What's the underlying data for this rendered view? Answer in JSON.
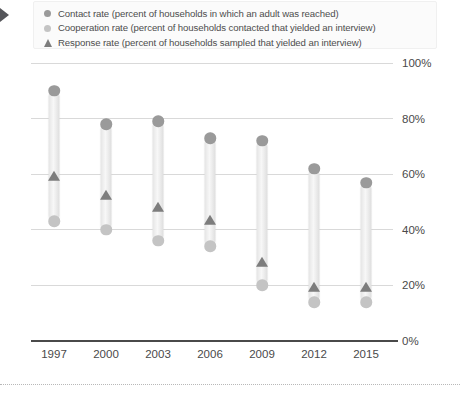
{
  "legend": {
    "items": [
      {
        "marker": "circle",
        "marker_name": "contact-rate-swatch",
        "color": "#9a9a9a",
        "label": "Contact rate (percent of households in which an adult was reached)"
      },
      {
        "marker": "circle",
        "marker_name": "cooperation-rate-swatch",
        "color": "#c4c4c4",
        "label": "Cooperation rate (percent of households contacted that yielded an interview)"
      },
      {
        "marker": "triangle",
        "marker_name": "response-rate-swatch",
        "color": "#7d7d7d",
        "label": "Response rate (percent of households sampled that yielded an interview)"
      }
    ]
  },
  "axes": {
    "y_ticks": [
      "100%",
      "80%",
      "60%",
      "40%",
      "20%",
      "0%"
    ],
    "x_ticks": [
      "1997",
      "2000",
      "2003",
      "2006",
      "2009",
      "2012",
      "2015"
    ]
  },
  "colors": {
    "contact": "#9a9a9a",
    "cooperation": "#c4c4c4",
    "response": "#7d7d7d",
    "bar": "#ededed",
    "grid": "#d9d9d9",
    "axis": "#4a4a4a",
    "text": "#4a4a4a"
  },
  "chart_data": {
    "type": "bar",
    "title": "",
    "subtitle": "",
    "xlabel": "",
    "ylabel": "",
    "ylim": [
      0,
      100
    ],
    "y_unit": "%",
    "grid": true,
    "legend_position": "top",
    "categories": [
      "1997",
      "2000",
      "2003",
      "2006",
      "2009",
      "2012",
      "2015"
    ],
    "series": [
      {
        "name": "Contact rate (percent of households in which an adult was reached)",
        "marker": "circle",
        "color": "#9a9a9a",
        "values": [
          90,
          78,
          79,
          73,
          72,
          62,
          57
        ]
      },
      {
        "name": "Cooperation rate (percent of households contacted that yielded an interview)",
        "marker": "circle",
        "color": "#c4c4c4",
        "values": [
          43,
          40,
          36,
          34,
          20,
          14,
          14
        ]
      },
      {
        "name": "Response rate (percent of households sampled that yielded an interview)",
        "marker": "triangle",
        "color": "#7d7d7d",
        "values": [
          59,
          52,
          48,
          43,
          28,
          19,
          19
        ]
      }
    ]
  }
}
